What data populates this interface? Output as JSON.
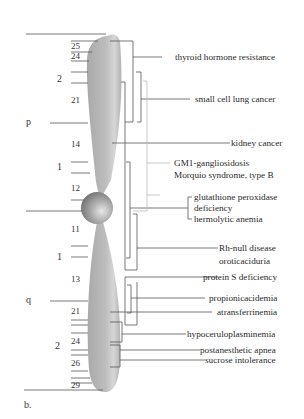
{
  "figure": {
    "caption": "b.",
    "arms": {
      "p": "p",
      "q": "q"
    },
    "regions": [
      {
        "label": "2",
        "y": 79
      },
      {
        "label": "1",
        "y": 165
      },
      {
        "label": "1",
        "y": 256
      },
      {
        "label": "2",
        "y": 346
      }
    ],
    "bands": [
      {
        "label": "25",
        "y": 47
      },
      {
        "label": "24",
        "y": 58
      },
      {
        "label": "21",
        "y": 100
      },
      {
        "label": "14",
        "y": 144
      },
      {
        "label": "12",
        "y": 188
      },
      {
        "label": "11",
        "y": 227
      },
      {
        "label": "13",
        "y": 280
      },
      {
        "label": "21",
        "y": 311
      },
      {
        "label": "24",
        "y": 340
      },
      {
        "label": "26",
        "y": 362
      },
      {
        "label": "29",
        "y": 386
      }
    ],
    "colors": {
      "chromosome": "#b8b8b8",
      "centromere": "#9a9a9a",
      "line_dark": "#555555",
      "line_light": "#bbbbbb",
      "text": "#2a2a2a"
    }
  },
  "diseases": [
    {
      "id": "thyroid",
      "lines": [
        "thyroid hormone resistance"
      ]
    },
    {
      "id": "sclc",
      "lines": [
        "small cell lung cancer"
      ]
    },
    {
      "id": "kidney",
      "lines": [
        "kidney cancer"
      ]
    },
    {
      "id": "gm1",
      "lines": [
        "GM1-gangliosidosis",
        "Morquio syndrome, type B"
      ]
    },
    {
      "id": "gpx",
      "lines": [
        "glutathione peroxidase",
        "deficiency"
      ]
    },
    {
      "id": "hemolytic",
      "lines": [
        "hermolytic anemia"
      ]
    },
    {
      "id": "rhnull",
      "lines": [
        "Rh-null disease",
        "oroticaciduria"
      ]
    },
    {
      "id": "proteinS",
      "lines": [
        "protein S deficiency"
      ]
    },
    {
      "id": "propionic",
      "lines": [
        "propionicacidemia"
      ]
    },
    {
      "id": "atransferrin",
      "lines": [
        "atransferrinemia"
      ]
    },
    {
      "id": "hypocerulo",
      "lines": [
        "hypoceruloplasminemia"
      ]
    },
    {
      "id": "apnea",
      "lines": [
        "postanesthetic apnea"
      ]
    },
    {
      "id": "sucrose",
      "lines": [
        "sucrose intolerance"
      ]
    }
  ]
}
